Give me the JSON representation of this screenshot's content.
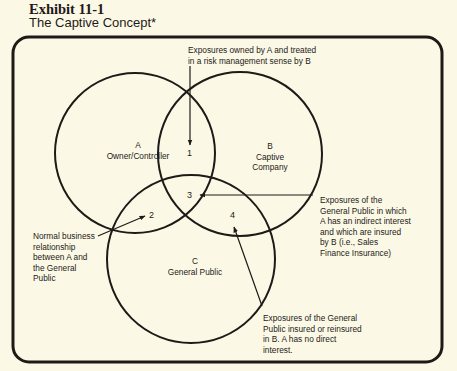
{
  "header": {
    "exhibit_number": "Exhibit 11-1",
    "title": "The Captive Concept*"
  },
  "diagram": {
    "type": "venn",
    "stroke_color": "#1e1a18",
    "background": "#fbf9e6",
    "circles": [
      {
        "id": "A",
        "letter": "A",
        "label": "Owner/Controller",
        "cx": 135,
        "cy": 153,
        "r": 80
      },
      {
        "id": "B",
        "letter": "B",
        "label_line1": "Captive",
        "label_line2": "Company",
        "cx": 240,
        "cy": 154,
        "r": 82
      },
      {
        "id": "C",
        "letter": "C",
        "label": "General Public",
        "cx": 191,
        "cy": 259,
        "r": 84
      }
    ],
    "regions": {
      "r1": "1",
      "r2": "2",
      "r3": "3",
      "r4": "4"
    },
    "annotations": {
      "top": {
        "line1": "Exposures owned by A and treated",
        "line2": "in a risk management sense by B"
      },
      "right": {
        "line1": "Exposures of the",
        "line2": "General Public in which",
        "line3": "A has an indirect interest",
        "line4": "and which are insured",
        "line5": "by B (i.e., Sales",
        "line6": "Finance Insurance)"
      },
      "left": {
        "line1": "Normal business",
        "line2": "relationship",
        "line3": "between A and",
        "line4": "the General",
        "line5": "Public"
      },
      "bottom": {
        "line1": "Exposures of the General",
        "line2": "Public insured or reinsured",
        "line3": "in B. A has no direct",
        "line4": "interest."
      }
    }
  }
}
